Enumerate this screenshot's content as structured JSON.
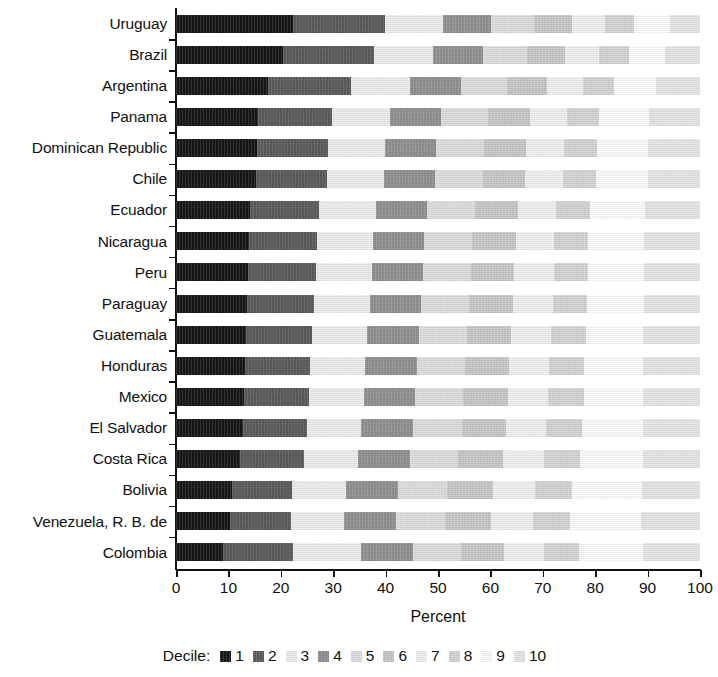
{
  "chart_data": {
    "type": "bar",
    "subtype": "stacked-horizontal-100pct",
    "title": "",
    "xlabel": "Percent",
    "ylabel": "",
    "xlim": [
      0,
      100
    ],
    "xticks": [
      0,
      10,
      20,
      30,
      40,
      50,
      60,
      70,
      80,
      90,
      100
    ],
    "xtick_labels": [
      "0",
      "10",
      "20",
      "30",
      "40",
      "50",
      "60",
      "70",
      "80",
      "90",
      "100"
    ],
    "grid": false,
    "legend_position": "bottom",
    "legend_title": "Decile:",
    "categories": [
      "Uruguay",
      "Brazil",
      "Argentina",
      "Panama",
      "Dominican Republic",
      "Chile",
      "Ecuador",
      "Nicaragua",
      "Peru",
      "Paraguay",
      "Guatemala",
      "Honduras",
      "Mexico",
      "El Salvador",
      "Costa Rica",
      "Bolivia",
      "Venezuela, R. B. de",
      "Colombia"
    ],
    "series": [
      {
        "name": "1",
        "color": "#141414",
        "values": [
          22.3,
          20.5,
          17.5,
          15.6,
          15.4,
          15.2,
          14.2,
          13.9,
          13.8,
          13.6,
          13.3,
          13.1,
          12.9,
          12.7,
          12.3,
          10.6,
          10.4,
          9.0
        ]
      },
      {
        "name": "2",
        "color": "#585858",
        "values": [
          17.5,
          17.3,
          15.9,
          14.2,
          13.6,
          13.6,
          13.1,
          13.0,
          12.9,
          12.8,
          12.6,
          12.5,
          12.4,
          12.3,
          12.1,
          11.6,
          11.5,
          13.4
        ]
      },
      {
        "name": "3",
        "color": "#ececed",
        "values": [
          11.1,
          11.2,
          11.2,
          11.0,
          10.9,
          10.9,
          10.8,
          10.7,
          10.7,
          10.6,
          10.6,
          10.5,
          10.5,
          10.4,
          10.4,
          10.3,
          10.2,
          13.0
        ]
      },
      {
        "name": "4",
        "color": "#8e8e8e",
        "values": [
          9.3,
          9.5,
          9.8,
          9.8,
          9.8,
          9.8,
          9.8,
          9.8,
          9.8,
          9.8,
          9.8,
          9.8,
          9.8,
          9.8,
          9.8,
          9.8,
          9.8,
          9.9
        ]
      },
      {
        "name": "5",
        "color": "#dcdcdc",
        "values": [
          8.2,
          8.4,
          8.7,
          8.9,
          9.0,
          9.0,
          9.1,
          9.1,
          9.1,
          9.2,
          9.2,
          9.2,
          9.2,
          9.3,
          9.3,
          9.4,
          9.4,
          9.0
        ]
      },
      {
        "name": "6",
        "color": "#c6c6c6",
        "values": [
          7.2,
          7.4,
          7.7,
          8.0,
          8.1,
          8.1,
          8.2,
          8.3,
          8.3,
          8.4,
          8.4,
          8.5,
          8.5,
          8.5,
          8.6,
          8.8,
          8.8,
          8.3
        ]
      },
      {
        "name": "7",
        "color": "#efefef",
        "values": [
          6.3,
          6.5,
          6.8,
          7.1,
          7.2,
          7.2,
          7.4,
          7.4,
          7.5,
          7.5,
          7.6,
          7.6,
          7.7,
          7.7,
          7.8,
          8.0,
          8.0,
          7.6
        ]
      },
      {
        "name": "8",
        "color": "#d3d3d3",
        "values": [
          5.5,
          5.6,
          6.0,
          6.2,
          6.3,
          6.3,
          6.5,
          6.5,
          6.6,
          6.6,
          6.7,
          6.7,
          6.8,
          6.8,
          6.9,
          7.1,
          7.1,
          6.8
        ]
      },
      {
        "name": "9",
        "color": "#fbfbfb",
        "values": [
          6.9,
          7.0,
          8.1,
          9.5,
          9.8,
          9.9,
          10.4,
          10.6,
          10.6,
          10.8,
          11.0,
          11.2,
          11.3,
          11.6,
          11.9,
          13.3,
          13.6,
          12.1
        ]
      },
      {
        "name": "10",
        "color": "#e4e4e4",
        "values": [
          5.7,
          6.6,
          8.3,
          9.7,
          9.9,
          10.0,
          10.5,
          10.7,
          10.7,
          10.7,
          10.8,
          10.9,
          10.9,
          10.9,
          10.9,
          11.1,
          11.2,
          10.9
        ]
      }
    ]
  },
  "axis": {
    "x_title": "Percent"
  },
  "legend": {
    "title": "Decile:"
  }
}
